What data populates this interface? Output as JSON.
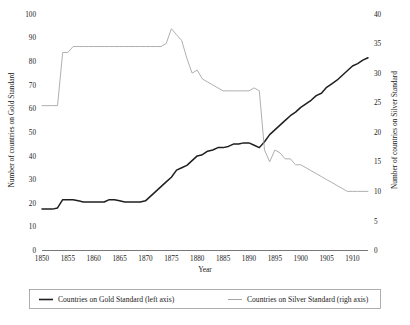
{
  "chart_data": {
    "type": "line",
    "title": "",
    "xlabel": "Year",
    "ylabel": "Number of countries on Gold Standard",
    "y2label": "Number of countries on Silver Standard",
    "xlim": [
      1850,
      1913
    ],
    "ylim": [
      0,
      100
    ],
    "y2lim": [
      0,
      40
    ],
    "grid": false,
    "legend_position": "bottom",
    "xticks": [
      1850,
      1855,
      1860,
      1865,
      1870,
      1875,
      1880,
      1885,
      1890,
      1895,
      1900,
      1905,
      1910
    ],
    "yticks": [
      0,
      10,
      20,
      30,
      40,
      50,
      60,
      70,
      80,
      90,
      100
    ],
    "y2ticks": [
      0,
      5,
      10,
      15,
      20,
      25,
      30,
      35,
      40
    ],
    "series": [
      {
        "name": "Countries on Gold Standard (left axis)",
        "axis": "left",
        "color": "#1f1f1f",
        "x": [
          1850,
          1851,
          1852,
          1853,
          1854,
          1855,
          1856,
          1857,
          1858,
          1859,
          1860,
          1861,
          1862,
          1863,
          1864,
          1865,
          1866,
          1867,
          1868,
          1869,
          1870,
          1871,
          1872,
          1873,
          1874,
          1875,
          1876,
          1877,
          1878,
          1879,
          1880,
          1881,
          1882,
          1883,
          1884,
          1885,
          1886,
          1887,
          1888,
          1889,
          1890,
          1891,
          1892,
          1893,
          1894,
          1895,
          1896,
          1897,
          1898,
          1899,
          1900,
          1901,
          1902,
          1903,
          1904,
          1905,
          1906,
          1907,
          1908,
          1909,
          1910,
          1911,
          1912,
          1913
        ],
        "values": [
          17.5,
          17.5,
          17.5,
          18,
          21.5,
          21.5,
          21.5,
          21,
          20.5,
          20.5,
          20.5,
          20.5,
          20.5,
          21.5,
          21.5,
          21,
          20.5,
          20.5,
          20.5,
          20.5,
          21,
          23,
          25,
          27,
          29,
          31,
          34,
          35,
          36,
          38,
          40,
          40.5,
          42,
          42.5,
          43.5,
          43.5,
          44,
          45,
          45,
          45.5,
          45.5,
          44.5,
          43.5,
          46,
          49,
          51,
          53,
          55,
          57,
          58.5,
          60.5,
          62,
          63.5,
          65.5,
          66.5,
          69,
          70.5,
          72,
          74,
          76,
          78,
          79,
          80.5,
          81.5
        ]
      },
      {
        "name": "Countries on Silver Standard (righ axis)",
        "axis": "right",
        "color": "#a6a6a6",
        "x": [
          1850,
          1851,
          1852,
          1853,
          1854,
          1855,
          1856,
          1857,
          1858,
          1859,
          1860,
          1861,
          1862,
          1863,
          1864,
          1865,
          1866,
          1867,
          1868,
          1869,
          1870,
          1871,
          1872,
          1873,
          1874,
          1875,
          1876,
          1877,
          1878,
          1879,
          1880,
          1881,
          1882,
          1883,
          1884,
          1885,
          1886,
          1887,
          1888,
          1889,
          1890,
          1891,
          1892,
          1893,
          1894,
          1895,
          1896,
          1897,
          1898,
          1899,
          1900,
          1901,
          1902,
          1903,
          1904,
          1905,
          1906,
          1907,
          1908,
          1909,
          1910,
          1911,
          1912,
          1913
        ],
        "values": [
          24.5,
          24.5,
          24.5,
          24.5,
          33.5,
          33.5,
          34.5,
          34.5,
          34.5,
          34.5,
          34.5,
          34.5,
          34.5,
          34.5,
          34.5,
          34.5,
          34.5,
          34.5,
          34.5,
          34.5,
          34.5,
          34.5,
          34.5,
          34.5,
          35,
          37.5,
          36.5,
          35.5,
          32.5,
          30,
          30.5,
          29,
          28.5,
          28,
          27.5,
          27,
          27,
          27,
          27,
          27,
          27,
          27.5,
          27,
          17,
          15,
          17,
          16.5,
          15.5,
          15.5,
          14.5,
          14.5,
          14,
          13.5,
          13,
          12.5,
          12,
          11.5,
          11,
          10.5,
          10,
          10,
          10,
          10,
          10
        ]
      }
    ]
  },
  "axes": {
    "left_title": "Number of countries on Gold Standard",
    "right_title": "Number of countries on Silver Standard",
    "x_title": "Year"
  },
  "legend": {
    "items": [
      {
        "label": "Countries on Gold Standard (left axis)",
        "style": "gold"
      },
      {
        "label": "Countries on Silver Standard (righ axis)",
        "style": "silver"
      }
    ]
  },
  "caption": {
    "text": ""
  }
}
